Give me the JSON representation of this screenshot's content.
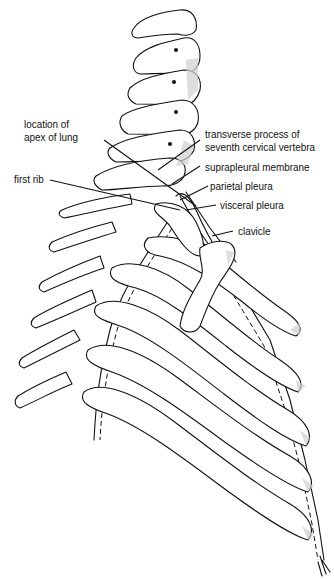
{
  "figure": {
    "labels": [
      {
        "id": "location_apex_lung",
        "text_line1": "location of",
        "text_line2": "apex of lung"
      },
      {
        "id": "first_rib",
        "text": "first rib"
      },
      {
        "id": "transverse_process",
        "text_line1": "transverse process of",
        "text_line2": "seventh cervical vertebra"
      },
      {
        "id": "suprapleural_membrane",
        "text": "suprapleural membrane"
      },
      {
        "id": "parietal_pleura",
        "text": "parietal pleura"
      },
      {
        "id": "visceral_pleura",
        "text": "visceral pleura"
      },
      {
        "id": "clavicle",
        "text": "clavicle"
      }
    ]
  }
}
